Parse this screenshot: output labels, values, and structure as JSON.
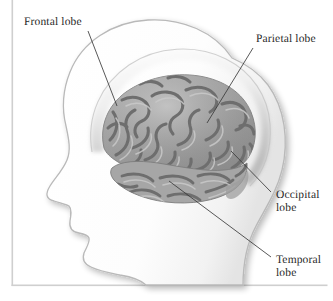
{
  "figure": {
    "background_color": "#ffffff",
    "frame_color": "#cfcfcf",
    "label_color": "#2a2a2a",
    "leader_line_color": "#3a3a3a",
    "head_fill": "#fdfdfd",
    "head_outline": "#b9b9b9",
    "skull_band_color": "#d8d8d8",
    "brain_mid_tone": "#9a9a9a",
    "brain_sulci_color": "#6e6e6e",
    "brain_gyri_highlight": "#c6c6c6"
  },
  "labels": [
    {
      "id": "frontal",
      "text": "Frontal lobe",
      "name": "label-frontal-lobe",
      "x": 24,
      "y": 16
    },
    {
      "id": "parietal",
      "text": "Parietal lobe",
      "name": "label-parietal-lobe",
      "x": 256,
      "y": 33
    },
    {
      "id": "occipital",
      "text": "Occipital\nlobe",
      "name": "label-occipital-lobe",
      "x": 276,
      "y": 189
    },
    {
      "id": "temporal",
      "text": "Temporal\nlobe",
      "name": "label-temporal-lobe",
      "x": 276,
      "y": 254
    }
  ],
  "leader_lines": [
    {
      "id": "frontal",
      "from": [
        88,
        31
      ],
      "to": [
        117,
        106
      ]
    },
    {
      "id": "parietal",
      "from": [
        253,
        48
      ],
      "to": [
        207,
        123
      ]
    },
    {
      "id": "occipital",
      "from": [
        271,
        192
      ],
      "to": [
        231,
        151
      ]
    },
    {
      "id": "temporal",
      "from": [
        271,
        257
      ],
      "to": [
        169,
        181
      ]
    }
  ]
}
